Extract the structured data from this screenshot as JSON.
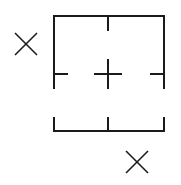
{
  "canvas": {
    "width": 181,
    "height": 185,
    "background": "#ffffff",
    "stroke": "#1a1a1a"
  },
  "diagram": {
    "frame": {
      "top": {
        "x1": 54,
        "y1": 16,
        "x2": 164,
        "y2": 16
      },
      "left": {
        "x1": 54,
        "y1": 16,
        "x2": 54,
        "y2": 88
      },
      "right": {
        "x1": 164,
        "y1": 16,
        "x2": 164,
        "y2": 88
      },
      "top_tick": {
        "x1": 108,
        "y1": 16,
        "x2": 108,
        "y2": 30
      },
      "left_tick": {
        "x1": 54,
        "y1": 74,
        "x2": 67,
        "y2": 74
      },
      "right_tick": {
        "x1": 151,
        "y1": 74,
        "x2": 164,
        "y2": 74
      }
    },
    "center_plus": {
      "cx": 108,
      "cy": 74,
      "half_w": 13,
      "half_h": 14
    },
    "bottom_bracket": {
      "base": {
        "x1": 54,
        "y1": 131,
        "x2": 164,
        "y2": 131
      },
      "left": {
        "x1": 54,
        "y1": 118,
        "x2": 54,
        "y2": 131
      },
      "mid": {
        "x1": 108,
        "y1": 118,
        "x2": 108,
        "y2": 131
      },
      "right": {
        "x1": 164,
        "y1": 118,
        "x2": 164,
        "y2": 131
      }
    },
    "markers": [
      {
        "label": "X",
        "cx": 26,
        "cy": 44,
        "half": 11
      },
      {
        "label": "X",
        "cx": 137,
        "cy": 162,
        "half": 11
      }
    ]
  }
}
